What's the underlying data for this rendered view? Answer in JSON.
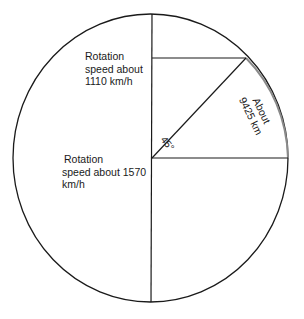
{
  "diagram": {
    "labels": {
      "upper_speed": [
        "Rotation",
        "speed about",
        "1110 km/h"
      ],
      "equator_speed": [
        "Rotation",
        "speed about 1570",
        "km/h"
      ],
      "arc_distance": [
        "About",
        "9425 km"
      ],
      "angle": "45°"
    },
    "values": {
      "speed_at_45_deg_kmh": 1110,
      "speed_at_equator_kmh": 1570,
      "arc_distance_km": 9425,
      "latitude_angle_deg": 45
    },
    "colors": {
      "outline": "#1a1a1a",
      "highlighted_arc": "#8a8a8a",
      "background": "#ffffff"
    }
  }
}
